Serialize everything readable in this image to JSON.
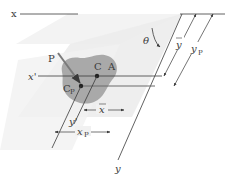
{
  "diagram": {
    "type": "centroid-center-of-pressure-inclined-plane",
    "labels": {
      "x_axis": "x",
      "x_prime": "x'",
      "y_axis": "y",
      "y_prime": "y'",
      "force": "P",
      "centroid": "C",
      "area": "A",
      "center_of_pressure": "C",
      "center_of_pressure_sub": "P",
      "angle": "θ",
      "y_bar": "y",
      "y_p": "y",
      "y_p_sub": "P",
      "x_bar": "x",
      "x_p": "x",
      "x_p_sub": "P"
    },
    "colors": {
      "surface": "#f0f0f0",
      "plane": "#e8e8e8",
      "blob": "#a9a9a9",
      "line": "#3a3a3a",
      "arrow": "#7a7a7a"
    }
  }
}
